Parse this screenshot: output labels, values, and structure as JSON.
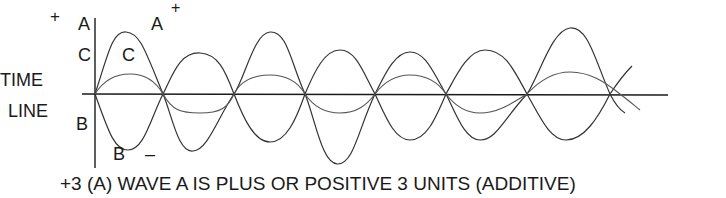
{
  "diagram": {
    "axis_labels": {
      "plus_top_left": "+",
      "a_left": "A",
      "c_left": "C",
      "b_left": "B",
      "time": "TIME",
      "line": "LINE"
    },
    "curve_labels": {
      "a_curve": "A",
      "a_plus": "+",
      "c_curve": "C",
      "b_curve": "B",
      "b_minus": "–"
    },
    "caption": {
      "prefix": "+3",
      "text": "(A) WAVE A IS PLUS OR POSITIVE 3 UNITS (ADDITIVE)"
    },
    "colors": {
      "ink": "#1a1a1a",
      "thin_ink": "#444444",
      "background": "#ffffff"
    }
  }
}
